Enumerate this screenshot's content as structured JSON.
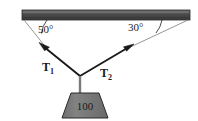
{
  "figure": {
    "type": "physics-force-diagram",
    "background_color": "#ffffff"
  },
  "ceiling": {
    "name": "ceiling-beam",
    "fill_color": "#4a4a4a",
    "edge_color": "#2a2a2a",
    "highlight_color": "#6e6e6e",
    "x_start": 22,
    "x_end": 190,
    "y_top": 10,
    "y_bottom": 20
  },
  "junction": {
    "name": "knot-point",
    "x": 80,
    "y": 76
  },
  "angles": {
    "left": {
      "label": "50°",
      "value": 50,
      "unit": "degrees",
      "label_x": 38,
      "label_y": 33,
      "arc_color": "#1a1a1a"
    },
    "right": {
      "label": "30°",
      "value": 30,
      "unit": "degrees",
      "label_x": 128,
      "label_y": 31,
      "arc_color": "#1a1a1a"
    }
  },
  "vectors": [
    {
      "name": "tension-1",
      "label_main": "T",
      "label_sub": "1",
      "label_x": 46,
      "label_y": 70,
      "tail_x": 80,
      "tail_y": 76,
      "head_x": 41,
      "head_y": 44,
      "color": "#1a1a1a"
    },
    {
      "name": "tension-2",
      "label_main": "T",
      "label_sub": "2",
      "label_x": 104,
      "label_y": 76,
      "tail_x": 80,
      "tail_y": 76,
      "head_x": 132,
      "head_y": 45,
      "color": "#1a1a1a"
    }
  ],
  "guide_lines": [
    {
      "name": "guide-line-left",
      "x1": 24,
      "y1": 20,
      "x2": 48,
      "y2": 50,
      "color": "#8a8a8a"
    },
    {
      "name": "guide-line-right",
      "x1": 188,
      "y1": 20,
      "x2": 124,
      "y2": 50,
      "color": "#8a8a8a"
    }
  ],
  "rope": {
    "name": "vertical-rope",
    "x": 80,
    "y_top": 76,
    "y_bottom": 93,
    "color": "#7a7a7a"
  },
  "weight": {
    "name": "hanging-weight",
    "label": "100",
    "fill_color": "#7d7d7d",
    "edge_color": "#2a2a2a",
    "top_left_x": 71,
    "top_right_x": 99,
    "bottom_left_x": 62,
    "bottom_right_x": 108,
    "y_top": 93,
    "y_bottom": 118,
    "label_x": 85,
    "label_y": 110
  }
}
